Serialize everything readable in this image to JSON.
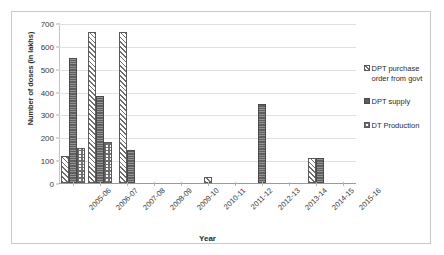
{
  "chart_data": {
    "type": "bar",
    "title": "",
    "xlabel": "Year",
    "ylabel": "Number of doses (in lakhs)",
    "ylim": [
      0,
      700
    ],
    "yticks": [
      0,
      100,
      200,
      300,
      400,
      500,
      600,
      700
    ],
    "grid": true,
    "legend_position": "right",
    "categories": [
      "2005-06",
      "2006-07",
      "2007-08",
      "2008-09",
      "2009-10",
      "2010-11",
      "2011-12",
      "2012-13",
      "2013-14",
      "2014-15",
      "2015-16"
    ],
    "series": [
      {
        "name": "DPT purchase order from govt",
        "pattern": "diagonal-hatch",
        "values": [
          120,
          660,
          660,
          0,
          0,
          25,
          0,
          0,
          0,
          110,
          0
        ]
      },
      {
        "name": "DPT supply",
        "pattern": "solid-dark",
        "values": [
          548,
          380,
          145,
          0,
          0,
          0,
          0,
          345,
          0,
          110,
          0
        ]
      },
      {
        "name": "DT Production",
        "pattern": "checkered",
        "values": [
          153,
          180,
          0,
          0,
          0,
          0,
          0,
          0,
          0,
          0,
          0
        ]
      }
    ]
  },
  "colors": {
    "bar_outline": "#5a5a5a",
    "solid_fill": "#5e5e5e",
    "hatch_stroke": "#6e6e6e",
    "gridline": "#e0e0e0",
    "axis": "#9a9a9a",
    "text": "#2b2b2b",
    "frame_border": "#c9c9c9",
    "background": "#ffffff"
  }
}
